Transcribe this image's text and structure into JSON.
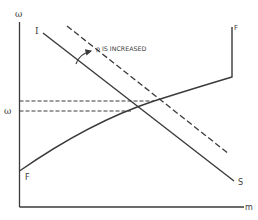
{
  "diagram": {
    "axes": {
      "y_label": "ω",
      "x_label": "m",
      "equilibrium_label": "ω"
    },
    "curves": {
      "supply_start_label": "I",
      "supply_end_label": "S",
      "demand_start_label": "F",
      "demand_end_label": "F"
    },
    "annotation": {
      "text": "ρ IS INCREASED"
    },
    "colors": {
      "ink": "#3a3a3a",
      "background": "#ffffff"
    }
  }
}
